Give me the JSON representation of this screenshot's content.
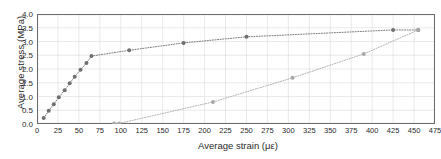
{
  "chart_data": {
    "type": "scatter",
    "title": "",
    "xlabel": "Average strain (με)",
    "ylabel": "Average stress (MPa)",
    "xlim": [
      0,
      475
    ],
    "ylim": [
      0.0,
      4.0
    ],
    "xticks": [
      0,
      25,
      50,
      75,
      100,
      125,
      150,
      175,
      200,
      225,
      250,
      275,
      300,
      325,
      350,
      375,
      400,
      425,
      450,
      475
    ],
    "yticks": [
      0.0,
      0.5,
      1.0,
      1.5,
      2.0,
      2.5,
      3.0,
      3.5,
      4.0
    ],
    "xticklabels": [
      "0",
      "25",
      "50",
      "75",
      "100",
      "125",
      "150",
      "175",
      "200",
      "225",
      "250",
      "275",
      "300",
      "325",
      "350",
      "375",
      "400",
      "425",
      "450",
      "475"
    ],
    "yticklabels": [
      "0.0",
      "0.5",
      "1.0",
      "1.5",
      "2.0",
      "2.5",
      "3.0",
      "3.5",
      "4.0"
    ],
    "grid": true,
    "legend": "none",
    "series": [
      {
        "name": "loading-curve-upper",
        "color": "#6f6f6f",
        "marker": "circle",
        "line": "dotted",
        "points": [
          [
            8,
            0.22
          ],
          [
            14,
            0.48
          ],
          [
            20,
            0.72
          ],
          [
            26,
            0.97
          ],
          [
            33,
            1.23
          ],
          [
            39,
            1.48
          ],
          [
            45,
            1.72
          ],
          [
            52,
            1.97
          ],
          [
            59,
            2.22
          ],
          [
            65,
            2.47
          ],
          [
            110,
            2.68
          ],
          [
            175,
            2.95
          ],
          [
            250,
            3.17
          ],
          [
            425,
            3.42
          ],
          [
            455,
            3.42
          ]
        ]
      },
      {
        "name": "unloading-curve-lower",
        "color": "#a8a8a8",
        "marker": "circle",
        "line": "dotted",
        "points": [
          [
            92,
            0.02
          ],
          [
            98,
            0.02
          ],
          [
            210,
            0.8
          ],
          [
            305,
            1.68
          ],
          [
            390,
            2.55
          ],
          [
            455,
            3.42
          ]
        ]
      }
    ]
  },
  "axes": {
    "frame_color": "#6b6b6b",
    "grid_color": "#dcdcdc"
  }
}
